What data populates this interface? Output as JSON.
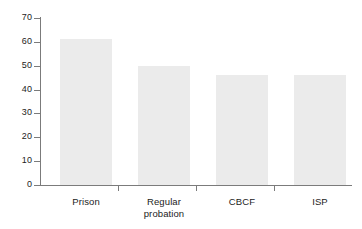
{
  "chart_data": {
    "type": "bar",
    "title": "",
    "subtitle": "",
    "xlabel": "",
    "ylabel": "",
    "categories": [
      "Prison",
      "Regular probation",
      "CBCF",
      "ISP"
    ],
    "category_lines": [
      [
        "Prison"
      ],
      [
        "Regular",
        "probation"
      ],
      [
        "CBCF"
      ],
      [
        "ISP"
      ]
    ],
    "values": [
      61,
      50,
      46,
      46
    ],
    "ylim": [
      0,
      70
    ],
    "y_ticks": [
      0,
      10,
      20,
      30,
      40,
      50,
      60,
      70
    ],
    "y_tick_labels": [
      "0",
      "10",
      "20",
      "30",
      "40",
      "50",
      "60",
      "70"
    ],
    "grid": false,
    "legend": false,
    "legend_position": "none",
    "bar_color": "#ebebeb",
    "axis_color": "#7b7b7b",
    "text_color": "#1c1c1c",
    "background_color": "#ffffff"
  }
}
